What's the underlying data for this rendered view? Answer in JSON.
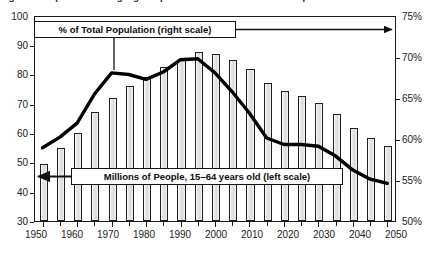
{
  "figure": {
    "title_remnant": "Figure 2.  Japan's Working-Age Population and Share of Total Population",
    "background_color": "#ffffff"
  },
  "callouts": {
    "percent_label": "% of Total Population (right scale)",
    "millions_label": "Millions of People, 15–64 years old (left scale)"
  },
  "axes": {
    "left": {
      "ticks": [
        "30",
        "40",
        "50",
        "60",
        "70",
        "80",
        "90",
        "100"
      ],
      "min": 30,
      "max": 100
    },
    "right": {
      "ticks": [
        "50%",
        "55%",
        "60%",
        "65%",
        "70%",
        "75%"
      ],
      "min": 50,
      "max": 75
    },
    "x": {
      "ticks": [
        "1950",
        "1960",
        "1970",
        "1980",
        "1990",
        "2000",
        "2010",
        "2020",
        "2030",
        "2040",
        "2050"
      ],
      "min": 1950,
      "max": 2050
    }
  },
  "colors": {
    "bar_fill": "#e3e3e3",
    "bar_stroke": "#1f1f1f",
    "line": "#000000",
    "frame": "#1a1a1a",
    "text": "#1c1c1c"
  },
  "chart_data": {
    "type": "bar",
    "title": "Figure 2.  Japan's Working-Age Population and Share of Total Population",
    "xlabel": "",
    "ylabel": "Millions of People, 15–64 years old",
    "y2label": "% of Total Population",
    "ylim": [
      30,
      100
    ],
    "y2lim": [
      50,
      75
    ],
    "grid": false,
    "legend_position": "inline-callout",
    "categories": [
      "1950",
      "1955",
      "1960",
      "1965",
      "1970",
      "1975",
      "1980",
      "1985",
      "1990",
      "1995",
      "2000",
      "2005",
      "2010",
      "2015",
      "2020",
      "2025",
      "2030",
      "2035",
      "2040",
      "2045",
      "2050"
    ],
    "series": [
      {
        "name": "Millions of People, 15–64 years old (left scale)",
        "type": "bar",
        "axis": "left",
        "unit": "millions",
        "values": [
          49.5,
          54.7,
          60.0,
          67.0,
          71.7,
          76.0,
          78.9,
          82.3,
          84.8,
          87.3,
          86.7,
          84.7,
          81.5,
          77.0,
          74.2,
          72.5,
          70.1,
          66.5,
          61.6,
          58.2,
          55.5
        ]
      },
      {
        "name": "% of Total Population (right scale)",
        "type": "line",
        "axis": "right",
        "unit": "percent",
        "x": [
          "1950",
          "1955",
          "1960",
          "1965",
          "1970",
          "1975",
          "1980",
          "1985",
          "1990",
          "1995",
          "2000",
          "2005",
          "2010",
          "2015",
          "2020",
          "2025",
          "2030",
          "2035",
          "2040",
          "2045",
          "2050"
        ],
        "values": [
          59.0,
          60.3,
          62.0,
          65.5,
          68.1,
          67.9,
          67.3,
          68.2,
          69.7,
          69.8,
          68.1,
          65.8,
          63.2,
          60.2,
          59.4,
          59.4,
          59.2,
          58.0,
          56.3,
          55.2,
          54.7
        ]
      }
    ]
  }
}
